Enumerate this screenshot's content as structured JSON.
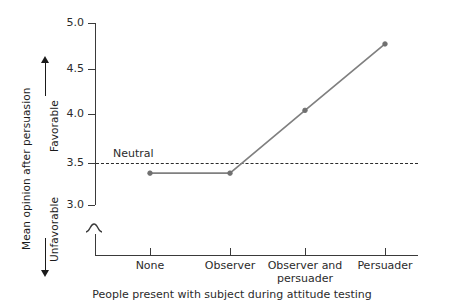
{
  "chart_data": {
    "type": "line",
    "title": "",
    "categories": [
      "None",
      "Observer",
      "Observer and persuader",
      "Persuader"
    ],
    "category_lines": [
      [
        "None"
      ],
      [
        "Observer"
      ],
      [
        "Observer and",
        "persuader"
      ],
      [
        "Persuader"
      ]
    ],
    "values": [
      3.35,
      3.35,
      4.04,
      4.77
    ],
    "series": [
      {
        "name": "Mean opinion after persuasion",
        "values": [
          3.35,
          3.35,
          4.04,
          4.77
        ]
      }
    ],
    "xlabel": "People present with subject during attitude testing",
    "ylabel": "Mean opinion after persuasion",
    "ylabel_positive": "Favorable",
    "ylabel_negative": "Unfavorable",
    "ylim": [
      3.0,
      5.0
    ],
    "yticks": [
      "5.0",
      "4.5",
      "4.0",
      "3.5",
      "3.0"
    ],
    "ytick_values": [
      5.0,
      4.5,
      4.0,
      3.5,
      3.0
    ],
    "grid": false,
    "legend": "none",
    "axis_break": true,
    "reference_line": {
      "label": "Neutral",
      "value": 3.5,
      "style": "dashed"
    },
    "colors": {
      "line": "#808080",
      "marker": "#707070",
      "axis": "#3a3a3a",
      "text": "#2b2b2b",
      "reference": "#2b2b2b",
      "background": "#ffffff"
    }
  }
}
